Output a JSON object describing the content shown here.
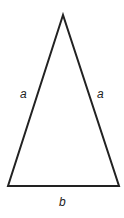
{
  "diagram": {
    "type": "isosceles-triangle",
    "stroke_color": "#222222",
    "vertices": {
      "apex": [
        63,
        15
      ],
      "bottom_left": [
        8,
        186
      ],
      "bottom_right": [
        119,
        186
      ]
    },
    "labels": {
      "left_side": "a",
      "right_side": "a",
      "base": "b"
    }
  }
}
